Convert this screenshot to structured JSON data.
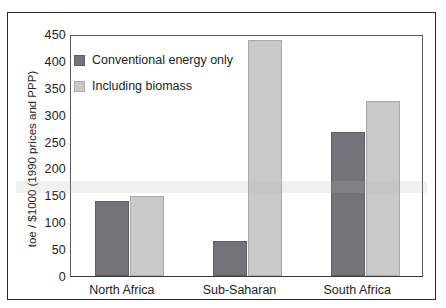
{
  "chart_data": {
    "type": "bar",
    "title": "",
    "xlabel": "",
    "ylabel": "toe / $1000 (1990 prices and PPP)",
    "categories": [
      "North Africa",
      "Sub-Saharan",
      "South Africa"
    ],
    "series": [
      {
        "name": "Conventional energy only",
        "color": "#73747a",
        "values": [
          140,
          65,
          268
        ]
      },
      {
        "name": "Including biomass",
        "color": "#c9cac8",
        "values": [
          148,
          438,
          325
        ]
      }
    ],
    "ylim": [
      0,
      450
    ],
    "yticks": [
      0,
      50,
      100,
      150,
      200,
      250,
      300,
      350,
      400,
      450
    ],
    "ytick_labels": [
      "0",
      "50",
      "100",
      "150",
      "200",
      "250",
      "300",
      "350",
      "400",
      "450"
    ],
    "grid": false,
    "legend_position": "top-left"
  },
  "legend": {
    "items": [
      {
        "label": "Conventional energy only",
        "swatch": "dark"
      },
      {
        "label": "Including biomass",
        "swatch": "light"
      }
    ]
  },
  "axes": {
    "y_title": "toe / $1000 (1990 prices and PPP)"
  }
}
